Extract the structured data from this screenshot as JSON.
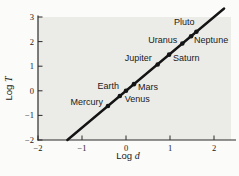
{
  "figure": {
    "colors": {
      "page_bg": "#fbfbf9",
      "plot_bg": "#ebebe8",
      "axis": "#2a2a2a",
      "line": "#141414",
      "point": "#141414",
      "text": "#1a1a1a"
    }
  },
  "chart_data": {
    "type": "scatter",
    "title": "",
    "xlabel": {
      "prefix": "Log",
      "symbol": "d"
    },
    "ylabel": {
      "prefix": "Log",
      "symbol": "T"
    },
    "xlim": [
      -2,
      2
    ],
    "ylim": [
      -2,
      3
    ],
    "x_ticks": [
      -2,
      -1,
      0,
      1,
      2
    ],
    "y_ticks": [
      -2,
      -1,
      0,
      1,
      2,
      3
    ],
    "grid": false,
    "legend": "none",
    "fit_line": {
      "slope": 1.5,
      "intercept": 0,
      "x_start": -1.333,
      "x_end": 2.23
    },
    "points": [
      {
        "name": "Mercury",
        "x": -0.41,
        "y": -0.62,
        "label_anchor": "end",
        "label_dx": -5,
        "label_dy": -1
      },
      {
        "name": "Venus",
        "x": -0.14,
        "y": -0.21,
        "label_anchor": "start",
        "label_dx": 5,
        "label_dy": 6
      },
      {
        "name": "Earth",
        "x": 0.0,
        "y": 0.0,
        "label_anchor": "end",
        "label_dx": -7,
        "label_dy": -2
      },
      {
        "name": "Mars",
        "x": 0.18,
        "y": 0.27,
        "label_anchor": "start",
        "label_dx": 4,
        "label_dy": 6
      },
      {
        "name": "Jupiter",
        "x": 0.72,
        "y": 1.07,
        "label_anchor": "end",
        "label_dx": -6,
        "label_dy": -3
      },
      {
        "name": "Saturn",
        "x": 0.98,
        "y": 1.47,
        "label_anchor": "start",
        "label_dx": 4,
        "label_dy": 6
      },
      {
        "name": "Uranus",
        "x": 1.28,
        "y": 1.92,
        "label_anchor": "end",
        "label_dx": -5,
        "label_dy": -1
      },
      {
        "name": "Neptune",
        "x": 1.48,
        "y": 2.22,
        "label_anchor": "start",
        "label_dx": 3,
        "label_dy": 7
      },
      {
        "name": "Pluto",
        "x": 1.6,
        "y": 2.4,
        "label_anchor": "end",
        "label_dx": -2,
        "label_dy": -7
      }
    ]
  }
}
